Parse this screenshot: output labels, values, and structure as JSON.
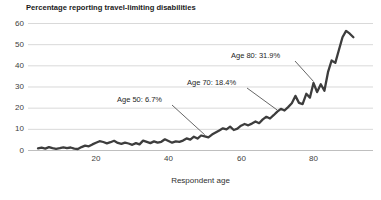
{
  "chart_data": {
    "type": "line",
    "title": "Percentage reporting travel-limiting disabilities",
    "xlabel": "Respondent age",
    "ylabel": "",
    "xlim": [
      0,
      97
    ],
    "ylim": [
      0,
      60
    ],
    "xticks": [
      20,
      40,
      60,
      80
    ],
    "yticks_top_to_bottom": [
      60,
      50,
      40,
      30,
      20,
      10,
      0
    ],
    "grid": "horizontal",
    "legend": "none",
    "colors": {
      "line": "#3d3d3d",
      "gridline": "#d9d9d9",
      "axis_line": "#bfbfbf",
      "text": "#404040",
      "background": "#ffffff"
    },
    "series": [
      {
        "name": "Percentage reporting travel-limiting disabilities",
        "x": [
          4,
          5,
          6,
          7,
          8,
          9,
          10,
          11,
          12,
          13,
          14,
          15,
          16,
          17,
          18,
          19,
          20,
          21,
          22,
          23,
          24,
          25,
          26,
          27,
          28,
          29,
          30,
          31,
          32,
          33,
          34,
          35,
          36,
          37,
          38,
          39,
          40,
          41,
          42,
          43,
          44,
          45,
          46,
          47,
          48,
          49,
          50,
          51,
          52,
          53,
          54,
          55,
          56,
          57,
          58,
          59,
          60,
          61,
          62,
          63,
          64,
          65,
          66,
          67,
          68,
          69,
          70,
          71,
          72,
          73,
          74,
          75,
          76,
          77,
          78,
          79,
          80,
          81,
          82,
          83,
          84,
          85,
          86,
          87,
          88,
          89,
          90,
          91
        ],
        "y": [
          1.0,
          1.3,
          0.9,
          1.6,
          1.1,
          0.8,
          1.1,
          1.5,
          1.1,
          1.4,
          0.9,
          0.7,
          1.6,
          2.3,
          2.0,
          2.9,
          3.7,
          4.4,
          4.0,
          3.4,
          3.9,
          4.6,
          3.6,
          3.1,
          3.7,
          3.3,
          2.7,
          3.5,
          2.9,
          4.7,
          4.1,
          3.5,
          4.3,
          3.7,
          4.1,
          5.3,
          4.5,
          3.7,
          4.3,
          4.1,
          4.7,
          5.7,
          5.1,
          6.5,
          5.6,
          7.1,
          6.7,
          6.2,
          7.5,
          8.5,
          9.5,
          10.5,
          10.0,
          11.3,
          9.7,
          10.3,
          11.7,
          12.5,
          11.9,
          12.7,
          13.7,
          12.9,
          14.7,
          15.9,
          15.1,
          16.7,
          18.4,
          19.7,
          18.9,
          20.5,
          22.3,
          25.8,
          22.5,
          21.9,
          26.8,
          25.0,
          31.9,
          27.6,
          31.3,
          28.2,
          37.0,
          42.5,
          41.4,
          47.5,
          53.5,
          56.5,
          55.2,
          53.5
        ]
      }
    ],
    "annotations": [
      {
        "label": "Age 50: 6.7%",
        "age": 50,
        "value": 6.7
      },
      {
        "label": "Age 70: 18.4%",
        "age": 70,
        "value": 18.4
      },
      {
        "label": "Age 80: 31.9%",
        "age": 80,
        "value": 31.9
      }
    ]
  }
}
